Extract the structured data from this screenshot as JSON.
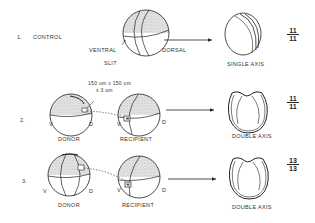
{
  "rows": [
    {
      "number": "1.",
      "title": "CONTROL",
      "labels": {
        "ventral": "VENTRAL",
        "dorsal": "DORSAL",
        "slit": "SLIT"
      },
      "result_label": "SINGLE AXIS",
      "fraction": {
        "numerator": "11",
        "denominator": "11"
      }
    },
    {
      "number": "2.",
      "graft_size": "150 um x 150 um",
      "graft_depth": "x 3 um",
      "donor": {
        "label": "DONOR",
        "v": "V",
        "d": "D"
      },
      "recipient": {
        "label": "RECIPIENT",
        "v": "V",
        "d": "D"
      },
      "result_label": "DOUBLE AXIS",
      "fraction": {
        "numerator": "11",
        "denominator": "11"
      }
    },
    {
      "number": "3.",
      "donor": {
        "label": "DONOR",
        "v": "V",
        "d": "D"
      },
      "recipient": {
        "label": "RECIPIENT",
        "v": "V",
        "d": "D"
      },
      "result_label": "DOUBLE AXIS",
      "fraction": {
        "numerator": "13",
        "denominator": "13"
      }
    }
  ]
}
